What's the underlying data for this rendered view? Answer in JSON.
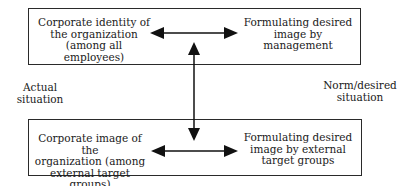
{
  "top_box": {
    "left_text": "Corporate identity of\nthe organization\n(among all employees)",
    "right_text": "Formulating desired\nimage by management"
  },
  "bottom_box": {
    "left_text": "Corporate image of the\norganization (among\nexternal target groups)",
    "right_text": "Formulating desired\nimage by external\ntarget groups"
  },
  "side_labels": {
    "left": "Actual\nsituation",
    "right": "Norm/desired\nsituation"
  },
  "colors": {
    "line": "#111111",
    "border": "#2a2a2a",
    "text": "#1a1a1a"
  }
}
